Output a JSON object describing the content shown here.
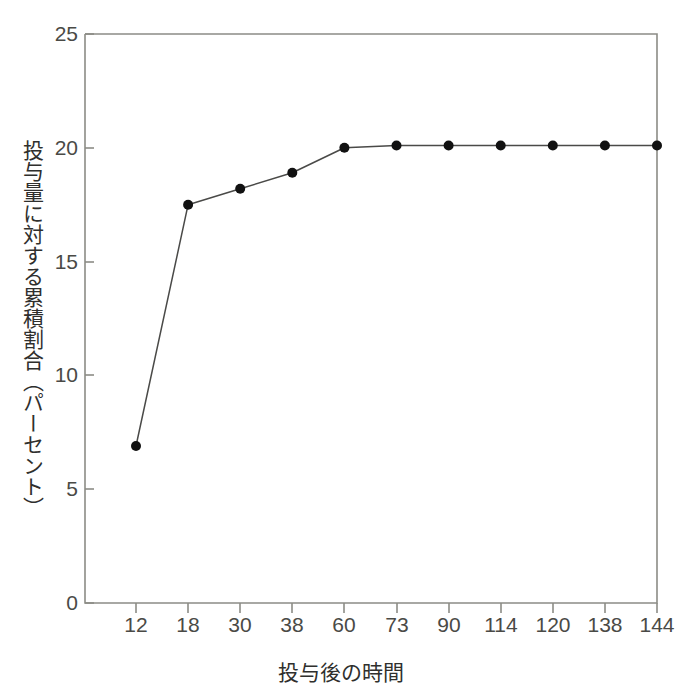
{
  "chart_data": {
    "type": "line",
    "title": "",
    "subtitle": "",
    "xlabel": "投与後の時間",
    "ylabel": "投与量に対する累積割合（パーセント）",
    "categories": [
      "12",
      "18",
      "30",
      "38",
      "60",
      "73",
      "90",
      "114",
      "120",
      "138",
      "144"
    ],
    "x": [
      12,
      18,
      30,
      38,
      60,
      73,
      90,
      114,
      120,
      138,
      144
    ],
    "values": [
      6.9,
      17.5,
      18.2,
      18.9,
      20.0,
      20.1,
      20.1,
      20.1,
      20.1,
      20.1,
      20.1
    ],
    "series": [
      {
        "name": "累積割合",
        "values": [
          6.9,
          17.5,
          18.2,
          18.9,
          20.0,
          20.1,
          20.1,
          20.1,
          20.1,
          20.1,
          20.1
        ]
      }
    ],
    "ylim": [
      0,
      25
    ],
    "yticks": [
      0,
      5,
      10,
      15,
      20,
      25
    ],
    "ytick_labels": [
      "0",
      "5",
      "10",
      "15",
      "20",
      "25"
    ],
    "xtick_labels": [
      "12",
      "18",
      "30",
      "38",
      "60",
      "73",
      "90",
      "114",
      "120",
      "138",
      "144"
    ],
    "grid": false,
    "legend": null,
    "axis_type": "categorical-x",
    "annotations": [],
    "colors": {
      "line": "#4a4a48",
      "marker": "#111111",
      "axis": "#8c8c86",
      "text": "#3a3a38",
      "background": "#ffffff"
    }
  },
  "axes": {
    "y_title": "投与量に対する累積割合（パーセント）",
    "x_title": "投与後の時間",
    "y_tick_labels": [
      "25",
      "20",
      "15",
      "10",
      "5",
      "0"
    ],
    "x_tick_labels": [
      "12",
      "18",
      "30",
      "38",
      "60",
      "73",
      "90",
      "114",
      "120",
      "138",
      "144"
    ]
  }
}
